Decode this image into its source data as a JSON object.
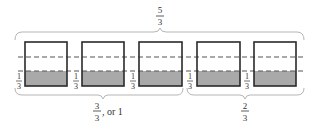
{
  "diagram": {
    "title_fraction": {
      "numerator": "5",
      "denominator": "3"
    },
    "boxes": [
      {
        "label_numerator": "1",
        "label_denominator": "3"
      },
      {
        "label_numerator": "1",
        "label_denominator": "3"
      },
      {
        "label_numerator": "1",
        "label_denominator": "3"
      },
      {
        "label_numerator": "1",
        "label_denominator": "3"
      },
      {
        "label_numerator": "1",
        "label_denominator": "3"
      }
    ],
    "group_left": {
      "numerator": "3",
      "denominator": "3",
      "suffix": ", or 1"
    },
    "group_right": {
      "numerator": "2",
      "denominator": "3"
    },
    "colors": {
      "box_stroke": "#2a2a2a",
      "shade": "#a9a9a9",
      "dash": "#555555",
      "brace": "#b5b5b5",
      "text": "#333333"
    }
  }
}
